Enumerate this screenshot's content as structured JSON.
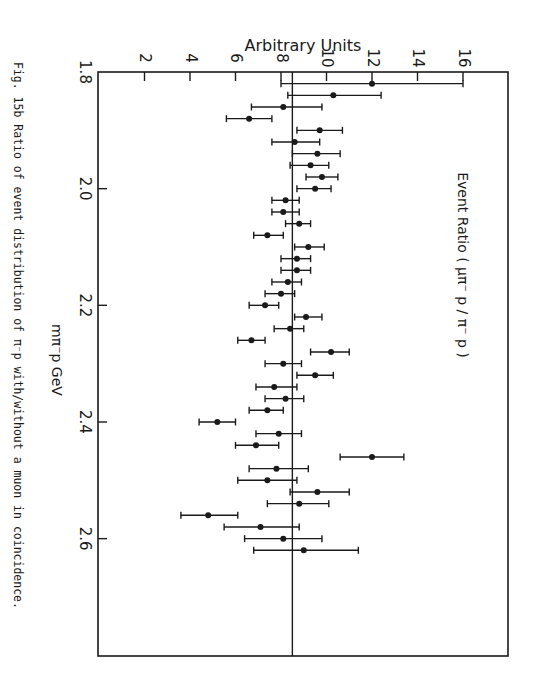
{
  "chart_data": {
    "type": "scatter",
    "title": "Event Ratio ( μπ⁻ p / π⁻ p )",
    "xlabel": "mπ⁻p GeV",
    "ylabel": "Arbitrary Units",
    "caption": "Fig. 15b   Ratio of event distribution of π⁻p with/without a muon in coincidence.",
    "xlim": [
      1.8,
      2.8
    ],
    "ylim": [
      0,
      18
    ],
    "x_ticks": [
      1.8,
      2.0,
      2.2,
      2.4,
      2.6
    ],
    "x_tick_labels": [
      "1.8",
      "2.0",
      "2.2",
      "2.4",
      "2.6"
    ],
    "y_ticks": [
      2,
      4,
      6,
      8,
      10,
      12,
      14,
      16
    ],
    "y_tick_labels": [
      "2",
      "4",
      "6",
      "8",
      "10",
      "12",
      "14",
      "16"
    ],
    "reference_line": 8.5,
    "grid": false,
    "orientation": "rotated-90deg-clockwise",
    "series": [
      {
        "name": "Event Ratio",
        "x": [
          1.82,
          1.84,
          1.86,
          1.88,
          1.9,
          1.92,
          1.94,
          1.96,
          1.98,
          2.0,
          2.02,
          2.04,
          2.06,
          2.08,
          2.1,
          2.12,
          2.14,
          2.16,
          2.18,
          2.2,
          2.22,
          2.24,
          2.26,
          2.28,
          2.3,
          2.32,
          2.34,
          2.36,
          2.38,
          2.4,
          2.42,
          2.44,
          2.46,
          2.48,
          2.5,
          2.52,
          2.54,
          2.56,
          2.58,
          2.6,
          2.62
        ],
        "values": [
          12.0,
          10.3,
          8.1,
          6.6,
          9.7,
          8.6,
          9.6,
          9.3,
          9.8,
          9.5,
          8.2,
          8.1,
          8.8,
          7.4,
          9.2,
          8.7,
          8.7,
          8.3,
          8.0,
          7.3,
          9.1,
          8.4,
          6.7,
          10.2,
          8.1,
          9.5,
          7.7,
          8.2,
          7.4,
          5.2,
          7.9,
          6.9,
          12.0,
          7.8,
          7.4,
          9.6,
          8.8,
          4.8,
          7.1,
          8.1,
          9.0
        ],
        "err_low": [
          8.0,
          8.3,
          6.7,
          5.6,
          8.7,
          7.6,
          8.5,
          8.4,
          9.1,
          8.7,
          7.6,
          7.6,
          8.2,
          6.8,
          8.6,
          8.0,
          8.0,
          7.6,
          7.3,
          6.6,
          8.6,
          7.7,
          6.1,
          9.3,
          7.3,
          8.7,
          6.9,
          7.3,
          6.6,
          4.4,
          6.9,
          6.0,
          10.6,
          6.6,
          6.1,
          8.4,
          7.4,
          3.6,
          5.5,
          6.4,
          6.8
        ],
        "err_high": [
          16.0,
          12.4,
          9.8,
          7.6,
          10.7,
          9.7,
          10.6,
          10.1,
          10.5,
          10.2,
          8.8,
          8.8,
          9.3,
          8.1,
          9.9,
          9.3,
          9.3,
          8.9,
          8.6,
          7.9,
          9.8,
          9.0,
          7.3,
          11.0,
          8.9,
          10.3,
          8.7,
          9.0,
          8.1,
          6.0,
          8.9,
          7.9,
          13.4,
          9.2,
          8.7,
          11.0,
          10.1,
          6.1,
          8.8,
          9.8,
          11.4
        ]
      }
    ]
  },
  "colors": {
    "ink": "#1a1a1a",
    "paper": "#ffffff"
  }
}
